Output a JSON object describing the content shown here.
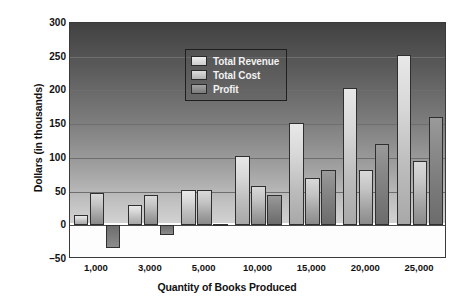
{
  "chart_data": {
    "type": "bar",
    "title": "",
    "xlabel": "Quantity of Books Produced",
    "ylabel": "Dollars (in thousands)",
    "categories": [
      "1,000",
      "3,000",
      "5,000",
      "10,000",
      "15,000",
      "20,000",
      "25,000"
    ],
    "series": [
      {
        "name": "Total Revenue",
        "values": [
          15,
          30,
          52,
          103,
          152,
          203,
          253
        ]
      },
      {
        "name": "Total Cost",
        "values": [
          48,
          45,
          52,
          58,
          70,
          82,
          95
        ]
      },
      {
        "name": "Profit",
        "values": [
          -33,
          -15,
          2,
          45,
          82,
          120,
          160
        ]
      }
    ],
    "ylim": [
      -50,
      300
    ],
    "yticks": [
      300,
      250,
      200,
      150,
      100,
      50,
      0,
      -50
    ],
    "ytick_labels": [
      "300",
      "250",
      "200",
      "150",
      "100",
      "50",
      "0",
      "–50"
    ],
    "grid": true,
    "legend_position": "top-center",
    "colors": {
      "total_revenue": "#d8d8d8",
      "total_cost": "#b4b4b4",
      "profit": "#808080",
      "plot_background_top": "#414141",
      "plot_background_bottom": "#d2d2d2",
      "axis_border": "#3a3a3a",
      "gridline": "#6e6e6e",
      "text": "#111111",
      "legend_text": "#f2f2f2"
    }
  }
}
